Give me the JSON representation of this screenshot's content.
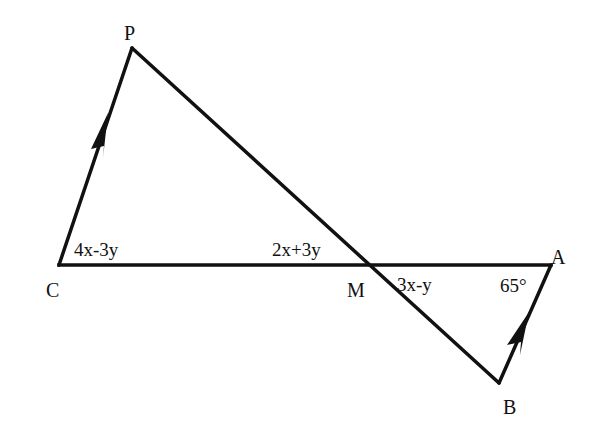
{
  "diagram": {
    "type": "geometry",
    "stroke_color": "#111111",
    "background_color": "#ffffff",
    "vertices": {
      "P": {
        "label": "P",
        "x": 132,
        "y": 48
      },
      "C": {
        "label": "C",
        "x": 59,
        "y": 265
      },
      "M": {
        "label": "M",
        "x": 368,
        "y": 265
      },
      "A": {
        "label": "A",
        "x": 551,
        "y": 265
      },
      "B": {
        "label": "B",
        "x": 499,
        "y": 383
      }
    },
    "segments": [
      {
        "from": "C",
        "to": "P",
        "parallel_mark": true
      },
      {
        "from": "P",
        "to": "B",
        "parallel_mark": false
      },
      {
        "from": "C",
        "to": "A",
        "parallel_mark": false
      },
      {
        "from": "B",
        "to": "A",
        "parallel_mark": true
      }
    ],
    "angle_labels": {
      "angle_C": "4x-3y",
      "angle_PMC": "2x+3y",
      "angle_AMB": "3x-y",
      "angle_A": "65°"
    }
  }
}
